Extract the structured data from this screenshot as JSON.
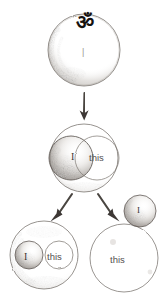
{
  "diagram": {
    "medium": "pencil sketch on white paper",
    "ink_color": "#3a3632",
    "pencil_color": "#8d8780",
    "background_color": "#ffffff",
    "nodes": [
      {
        "id": "top",
        "name": "om-circle",
        "label": "ॐ",
        "inner_mark": "|",
        "shading": "crescent shading along lower-left inner rim",
        "cx": 84,
        "cy": 50,
        "r": 36
      },
      {
        "id": "middle",
        "name": "overlap-circle",
        "children": [
          {
            "id": "mid-i",
            "label": "I",
            "shaded": true,
            "cx": 71,
            "cy": 158,
            "r": 22
          },
          {
            "id": "mid-this",
            "label": "this",
            "shaded": false,
            "cx": 97,
            "cy": 158,
            "r": 22
          }
        ],
        "cx": 84,
        "cy": 158,
        "r": 34
      },
      {
        "id": "bottom-left",
        "name": "contained-circle",
        "children": [
          {
            "id": "bl-i",
            "label": "I",
            "shaded": true,
            "cx": 29,
            "cy": 255,
            "r": 14
          },
          {
            "id": "bl-this",
            "label": "this",
            "shaded": false,
            "cx": 59,
            "cy": 255,
            "r": 14
          }
        ],
        "cx": 44,
        "cy": 255,
        "r": 34
      },
      {
        "id": "bottom-right",
        "name": "separated-circles",
        "children": [
          {
            "id": "br-i",
            "label": "I",
            "shaded": true,
            "cx": 140,
            "cy": 211,
            "r": 16
          },
          {
            "id": "br-this",
            "label": "this",
            "shaded": false,
            "cx": 124,
            "cy": 258,
            "r": 34
          }
        ]
      }
    ],
    "arrows": [
      {
        "id": "a1",
        "name": "arrow-down",
        "direction": "down",
        "from": "top",
        "to": "middle",
        "x1": 84,
        "y1": 92,
        "x2": 84,
        "y2": 119
      },
      {
        "id": "a2",
        "name": "arrow-down-left",
        "direction": "down-left",
        "from": "middle",
        "to": "bottom-left",
        "x1": 70,
        "y1": 194,
        "x2": 54,
        "y2": 218
      },
      {
        "id": "a3",
        "name": "arrow-down-right",
        "direction": "down-right",
        "from": "middle",
        "to": "bottom-right",
        "x1": 100,
        "y1": 194,
        "x2": 116,
        "y2": 218
      }
    ],
    "labels": {
      "om": "ॐ",
      "top_i": "|",
      "mid_i": "I",
      "mid_this": "this",
      "bottom_left_i": "I",
      "bottom_left_this": "this",
      "bottom_right_i": "I",
      "bottom_right_this": "this"
    }
  }
}
